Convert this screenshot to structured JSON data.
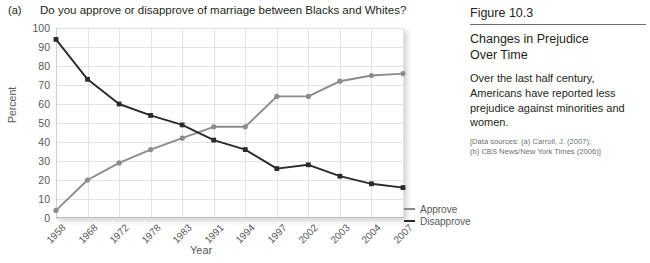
{
  "panel": {
    "letter": "(a)",
    "question": "Do you approve or disapprove of marriage between Blacks and Whites?"
  },
  "figure": {
    "number": "Figure 10.3",
    "title_line1": "Changes in Prejudice",
    "title_line2": "Over Time",
    "body": "Over the last half century, Americans have reported less prejudice against minorities and women.",
    "sources_line1": "[Data sources: (a) Carroll, J. (2007);",
    "sources_line2": "(b) CBS News/New York Times (2006)]"
  },
  "colors": {
    "approve": "#8c8c8c",
    "disapprove": "#2b2b2b",
    "grid": "#e3e3e3",
    "axis_text": "#58595b"
  },
  "chart_data": {
    "type": "line",
    "title": "Do you approve or disapprove of marriage between Blacks and Whites?",
    "xlabel": "Year",
    "ylabel": "Percent",
    "ylim": [
      0,
      100
    ],
    "ytick_step": 10,
    "yticks": [
      0,
      10,
      20,
      30,
      40,
      50,
      60,
      70,
      80,
      90,
      100
    ],
    "categories": [
      "1958",
      "1968",
      "1972",
      "1978",
      "1983",
      "1991",
      "1994",
      "1997",
      "2002",
      "2003",
      "2004",
      "2007"
    ],
    "grid": true,
    "legend_position": "right",
    "series": [
      {
        "name": "Approve",
        "color": "#8c8c8c",
        "marker": "circle",
        "values": [
          4,
          20,
          29,
          36,
          42,
          48,
          48,
          64,
          64,
          72,
          75,
          76
        ]
      },
      {
        "name": "Disapprove",
        "color": "#2b2b2b",
        "marker": "square",
        "values": [
          94,
          73,
          60,
          54,
          49,
          41,
          36,
          26,
          28,
          22,
          18,
          16
        ]
      }
    ]
  }
}
